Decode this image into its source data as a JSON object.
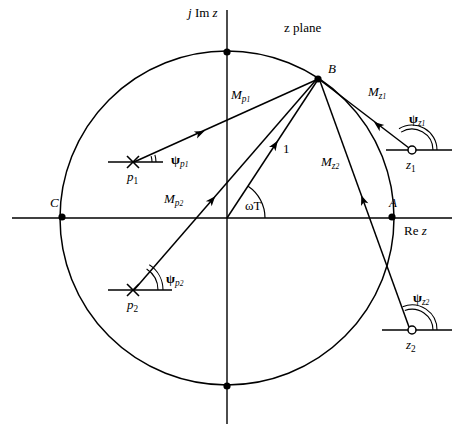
{
  "figure": {
    "title": "z plane",
    "axis_imaginary_label": "j Im z",
    "axis_real_label": "Re z",
    "background_color": "#ffffff",
    "stroke_color": "#000000"
  },
  "points": [
    {
      "id": "A",
      "label": "A",
      "marker": "dot",
      "x": 392,
      "y": 216,
      "label_x": 389,
      "label_y": 198
    },
    {
      "id": "B",
      "label": "B",
      "marker": "dot",
      "x": 318,
      "y": 79,
      "label_x": 327,
      "label_y": 64
    },
    {
      "id": "C",
      "label": "C",
      "marker": "dot",
      "x": 62,
      "y": 216,
      "label_x": 48,
      "label_y": 198
    },
    {
      "id": "top",
      "label": "",
      "marker": "dot",
      "x": 227,
      "y": 52
    },
    {
      "id": "bottom",
      "label": "",
      "marker": "dot",
      "x": 227,
      "y": 386
    }
  ],
  "poles": [
    {
      "id": "p1",
      "label": "p1",
      "label_text": "p",
      "sub": "1",
      "marker": "cross",
      "x": 133,
      "y": 162,
      "angle_label": "ψp1",
      "angle_symbol": "ψ",
      "angle_sub": "p1"
    },
    {
      "id": "p2",
      "label": "p2",
      "label_text": "p",
      "sub": "2",
      "marker": "cross",
      "x": 133,
      "y": 290,
      "angle_label": "ψp2",
      "angle_symbol": "ψ",
      "angle_sub": "p2"
    }
  ],
  "zeros": [
    {
      "id": "z1",
      "label": "z1",
      "label_text": "z",
      "sub": "1",
      "marker": "circle",
      "x": 412,
      "y": 150,
      "angle_label": "ψz1",
      "angle_symbol": "ψ",
      "angle_sub": "z1"
    },
    {
      "id": "z2",
      "label": "z2",
      "label_text": "z",
      "sub": "2",
      "marker": "circle",
      "x": 412,
      "y": 330,
      "angle_label": "ψz2",
      "angle_symbol": "ψ",
      "angle_sub": "z2"
    }
  ],
  "vectors": [
    {
      "id": "Mp1",
      "base": "M",
      "sub": "p1",
      "from": "p1",
      "to": "B",
      "label_x": 232,
      "label_y": 89
    },
    {
      "id": "Mp2",
      "base": "M",
      "sub": "p2",
      "from": "p2",
      "to": "B",
      "label_x": 166,
      "label_y": 196
    },
    {
      "id": "Mz1",
      "base": "M",
      "sub": "z1",
      "from": "z1",
      "to": "B",
      "label_x": 369,
      "label_y": 86
    },
    {
      "id": "Mz2",
      "base": "M",
      "sub": "z2",
      "from": "z2",
      "to": "B",
      "label_x": 322,
      "label_y": 157
    },
    {
      "id": "unit",
      "base": "1",
      "sub": "",
      "from": "origin",
      "to": "B",
      "label_x": 283,
      "label_y": 145
    }
  ],
  "angles": [
    {
      "id": "omegaT",
      "label": "ωT",
      "label_x": 245,
      "label_y": 207,
      "at": "origin",
      "description": "angle from positive real axis to vector OB"
    }
  ],
  "circle": {
    "center_x": 227,
    "center_y": 218,
    "radius": 167,
    "label": "unit circle"
  }
}
